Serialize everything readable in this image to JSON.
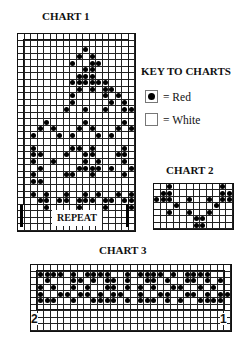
{
  "chart1": {
    "title": "CHART 1",
    "repeat_label": "REPEAT",
    "cols": 18,
    "rows": [
      "..................",
      "..................",
      "..........x.......",
      ".........x.x......",
      "........x..xx.....",
      "..........xx......",
      ".........xxx......",
      "........xxxxxx....",
      ".........x.x.xx...",
      "........x....x.x..",
      "........x.....x.x.",
      ".......x..x..x..xx",
      "..................",
      "....x.....x.....x.",
      "...x.x...x.x...x.x",
      "..x...x.x...x.x...",
      "..................",
      "..x.....xx.x....x.",
      "..xx...x..xx...xx.",
      "..x..x....x.x...x.",
      "...x.....xxxx.x..x",
      "..x....xx..x....x.",
      "..xx..............",
      "..................",
      "..x.x..x..x.x..x.x",
      "...xx.xx.xxx.xx.xx",
      "....x....x...x...x",
      "..................",
      "..................",
      ".................."
    ]
  },
  "key": {
    "title": "KEY TO CHARTS",
    "items": [
      {
        "symbol": "dot",
        "label": "= Red",
        "color": "#000000"
      },
      {
        "symbol": "blank",
        "label": "= White",
        "color": "#ffffff"
      }
    ]
  },
  "chart2": {
    "title": "CHART 2",
    "cols": 12,
    "rows": [
      "..x.......x.",
      ".xx.......xx",
      "xxx..x..x.xx",
      "...x.....x..",
      "..x..x..x...",
      "......xx....",
      "......xx...."
    ]
  },
  "chart3": {
    "title": "CHART 3",
    "cols": 30,
    "start_left_label": "2",
    "start_right_label": "1",
    "rows": [
      "..............................",
      ".xxxx.x.xxxx..x.xxxx.x.xxxx...",
      "..x...xx.x.xx.x..xx.x..xx.x.x.",
      ".x.x..x.x..xx.x.x.x..xx..x.x..",
      ".x..xx.xx.x.xx..x..xx..xx.x.xx",
      ".xxx..x..xxxx.x.xxx.x.x..xxxx.",
      "..............................",
      "..............................",
      "..............................",
      ".............................."
    ]
  }
}
